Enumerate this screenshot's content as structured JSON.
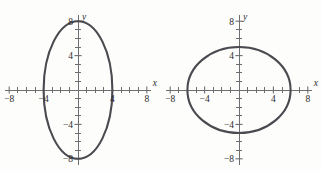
{
  "figure": {
    "name": "two-ellipse-graphs",
    "background_color": "#fdfdfb",
    "curve_color": "#4a4a50",
    "axis_color": "#6e6e72",
    "label_color": "#2b2b2e"
  },
  "chart_data": [
    {
      "type": "line",
      "name": "vertical-ellipse",
      "title": "",
      "xlabel": "x",
      "ylabel": "y",
      "xlim": [
        -8,
        8
      ],
      "ylim": [
        -8,
        8
      ],
      "grid": false,
      "legend": "none",
      "xticks": [
        -8,
        -7,
        -6,
        -5,
        -4,
        -3,
        -2,
        -1,
        1,
        2,
        3,
        4,
        5,
        6,
        7,
        8
      ],
      "yticks": [
        -8,
        -7,
        -6,
        -5,
        -4,
        -3,
        -2,
        -1,
        1,
        2,
        3,
        4,
        5,
        6,
        7,
        8
      ],
      "xtick_labels": [
        {
          "value": -8,
          "text": "−8"
        },
        {
          "value": -4,
          "text": "−4"
        },
        {
          "value": 4,
          "text": "4"
        },
        {
          "value": 8,
          "text": "8"
        }
      ],
      "ytick_labels": [
        {
          "value": 8,
          "text": "8"
        },
        {
          "value": 4,
          "text": "4"
        },
        {
          "value": -4,
          "text": "−4"
        },
        {
          "value": -8,
          "text": "−8"
        }
      ],
      "shape": "ellipse",
      "center": [
        0,
        0
      ],
      "semi_axis_x": 4,
      "semi_axis_y": 8,
      "orientation": "vertical",
      "x_intercepts": [
        -4,
        4
      ],
      "y_intercepts": [
        -8,
        8
      ],
      "annotations": []
    },
    {
      "type": "line",
      "name": "horizontal-ellipse",
      "title": "",
      "xlabel": "x",
      "ylabel": "y",
      "xlim": [
        -8,
        8
      ],
      "ylim": [
        -8,
        8
      ],
      "grid": false,
      "legend": "none",
      "xticks": [
        -8,
        -7,
        -6,
        -5,
        -4,
        -3,
        -2,
        -1,
        1,
        2,
        3,
        4,
        5,
        6,
        7,
        8
      ],
      "yticks": [
        -8,
        -7,
        -6,
        -5,
        -4,
        -3,
        -2,
        -1,
        1,
        2,
        3,
        4,
        5,
        6,
        7,
        8
      ],
      "xtick_labels": [
        {
          "value": -8,
          "text": "−8"
        },
        {
          "value": -4,
          "text": "−4"
        },
        {
          "value": 4,
          "text": "4"
        },
        {
          "value": 8,
          "text": "8"
        }
      ],
      "ytick_labels": [
        {
          "value": 8,
          "text": "8"
        },
        {
          "value": 4,
          "text": "4"
        },
        {
          "value": -4,
          "text": "−4"
        },
        {
          "value": -8,
          "text": "−8"
        }
      ],
      "shape": "ellipse",
      "center": [
        0,
        0
      ],
      "semi_axis_x": 6,
      "semi_axis_y": 5,
      "orientation": "horizontal",
      "x_intercepts": [
        -6,
        6
      ],
      "y_intercepts": [
        -5,
        5
      ],
      "annotations": []
    }
  ]
}
